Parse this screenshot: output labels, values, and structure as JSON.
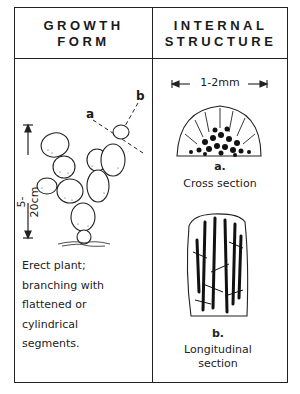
{
  "headers": {
    "growth_form": [
      "GROWTH",
      "FORM"
    ],
    "internal_structure": [
      "INTERNAL",
      "STRUCTURE"
    ]
  },
  "growth_form": {
    "height_scale": "5-20cm",
    "section_labels": {
      "a": "a",
      "b": "b"
    },
    "description": [
      "Erect plant;",
      "branching with",
      "flattened or",
      "cylindrical",
      "segments."
    ]
  },
  "internal_structure": {
    "width_scale": "1-2mm",
    "cross_section": {
      "letter": "a.",
      "label": "Cross section"
    },
    "longitudinal_section": {
      "letter": "b.",
      "label": [
        "Longitudinal",
        "section"
      ]
    }
  }
}
